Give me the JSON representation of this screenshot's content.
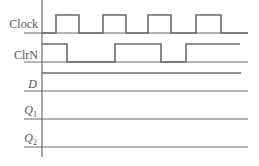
{
  "diagram": {
    "type": "timing-diagram",
    "line_color": "#6b6b6b",
    "signals": [
      {
        "name": "Clock",
        "italic": false,
        "subscript": "",
        "label_y": 28,
        "high_y": 15,
        "low_y": 33,
        "waveform": [
          [
            42,
            "low"
          ],
          [
            56,
            "high"
          ],
          [
            79,
            "low"
          ],
          [
            103,
            "high"
          ],
          [
            126,
            "low"
          ],
          [
            148,
            "high"
          ],
          [
            171,
            "low"
          ],
          [
            196,
            "high"
          ],
          [
            221,
            "low"
          ],
          [
            248,
            "end"
          ]
        ]
      },
      {
        "name": "ClrN",
        "italic": false,
        "subscript": "",
        "label_y": 59,
        "high_y": 44,
        "low_y": 62,
        "waveform": [
          [
            42,
            "high"
          ],
          [
            67,
            "low"
          ],
          [
            115,
            "high"
          ],
          [
            161,
            "low"
          ],
          [
            186,
            "high"
          ],
          [
            240,
            "end"
          ]
        ]
      },
      {
        "name": "D",
        "italic": true,
        "subscript": "",
        "label_y": 88,
        "high_y": 73,
        "low_y": 91,
        "waveform": [
          [
            42,
            "high"
          ],
          [
            241,
            "end"
          ]
        ]
      },
      {
        "name": "Q",
        "italic": true,
        "subscript": "1",
        "label_y": 114,
        "high_y": 101,
        "low_y": 119,
        "waveform": []
      },
      {
        "name": "Q",
        "italic": true,
        "subscript": "2",
        "label_y": 142,
        "high_y": 129,
        "low_y": 147,
        "waveform": []
      }
    ],
    "axis": {
      "x": 42,
      "y_top": 0,
      "y_bottom": 157
    },
    "dividers": [
      {
        "y": 33,
        "x1": 24,
        "x2": 248
      },
      {
        "y": 62,
        "x1": 24,
        "x2": 248
      },
      {
        "y": 91,
        "x1": 24,
        "x2": 248
      },
      {
        "y": 119,
        "x1": 24,
        "x2": 248
      },
      {
        "y": 147,
        "x1": 24,
        "x2": 248
      }
    ]
  },
  "labels": {
    "clock": "Clock",
    "clrn": "ClrN",
    "d": "D",
    "q1_main": "Q",
    "q1_sub": "1",
    "q2_main": "Q",
    "q2_sub": "2"
  }
}
